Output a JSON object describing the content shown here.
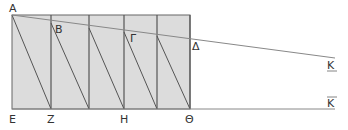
{
  "diagram": {
    "labels": {
      "A": "Α",
      "B": "Β",
      "G": "Γ",
      "D": "Δ",
      "E": "Ε",
      "Z": "Ζ",
      "H": "Η",
      "Th": "Θ",
      "K_upper": "K",
      "K_lower": "K"
    },
    "colors": {
      "fill": "#dcdcdc",
      "stroke": "#555555",
      "line": "#888888"
    }
  }
}
